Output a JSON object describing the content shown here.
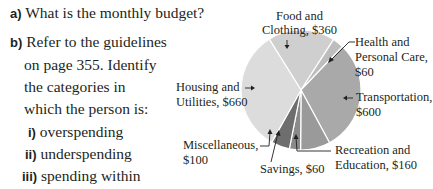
{
  "questions": {
    "a": {
      "label": "a)",
      "text": "What is the monthly budget?"
    },
    "b": {
      "label": "b)",
      "lines": [
        "Refer to the guidelines",
        "on page 355. Identify",
        "the categories in",
        "which the person is:"
      ],
      "sub": [
        {
          "label": "i)",
          "text": "overspending"
        },
        {
          "label": "ii)",
          "text": "underspending"
        },
        {
          "label": "iii)",
          "text": "spending within",
          "text2": "the guidelines"
        }
      ]
    }
  },
  "chart_data": {
    "type": "pie",
    "title": "",
    "total": 2000,
    "slices": [
      {
        "name": "Food and Clothing",
        "value": 360,
        "label1": "Food and",
        "label2": "Clothing, $360",
        "color": "#cfcfcf"
      },
      {
        "name": "Health and Personal Care",
        "value": 60,
        "label1": "Health and",
        "label2": "Personal Care,",
        "label3": "$60",
        "color": "#bdbdbd"
      },
      {
        "name": "Transportation",
        "value": 600,
        "label1": "Transportation,",
        "label2": "$600",
        "color": "#a9a9a9"
      },
      {
        "name": "Recreation and Education",
        "value": 160,
        "label1": "Recreation and",
        "label2": "Education, $160",
        "color": "#9a9a9a"
      },
      {
        "name": "Savings",
        "value": 60,
        "label1": "Savings, $60",
        "color": "#8a8a8a"
      },
      {
        "name": "Miscellaneous",
        "value": 100,
        "label1": "Miscellaneous,",
        "label2": "$100",
        "color": "#6e6e6e"
      },
      {
        "name": "Housing and Utilities",
        "value": 660,
        "label1": "Housing and",
        "label2": "Utilities, $660",
        "color": "#dcdcdc"
      }
    ]
  }
}
